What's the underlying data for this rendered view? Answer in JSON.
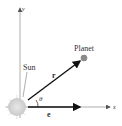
{
  "diagram": {
    "axes": {
      "x_label": "x",
      "y_label": "y"
    },
    "labels": {
      "sun": "Sun",
      "planet": "Planet",
      "radius_vector": "r",
      "angle": "θ",
      "eccentricity_vector": "e"
    },
    "colors": {
      "axis": "#9a9a9a",
      "vector": "#222222",
      "planet": "#8a8a8a",
      "sun": "#d4d4d4"
    }
  }
}
